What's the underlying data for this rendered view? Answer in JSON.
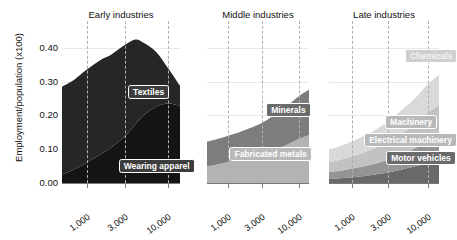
{
  "chart_data": {
    "type": "area",
    "title": "",
    "ylabel": "Employment/population (x100)",
    "xlabel": "",
    "ylim": [
      0.0,
      0.45
    ],
    "yticks": [
      "0.00",
      "0.10",
      "0.20",
      "0.30",
      "0.40"
    ],
    "ytick_values": [
      0.0,
      0.1,
      0.2,
      0.3,
      0.4
    ],
    "xticks": [
      "1,000",
      "3,000",
      "10,000"
    ],
    "xtick_values": [
      1000,
      3000,
      10000
    ],
    "xscale": "log",
    "grid": "vertical dashed at x ticks, faint horizontal at y ticks",
    "legend": "inline labels on stacked areas",
    "stacked": true,
    "panels": [
      {
        "name": "early",
        "title": "Early industries",
        "x": [
          500,
          700,
          1000,
          1500,
          2000,
          3000,
          4000,
          5000,
          7000,
          10000,
          14000
        ],
        "series": [
          {
            "name": "Wearing apparel",
            "color": "#141414",
            "label_tone": "dark",
            "values": [
              0.025,
              0.04,
              0.06,
              0.085,
              0.105,
              0.14,
              0.175,
              0.2,
              0.225,
              0.235,
              0.228
            ]
          },
          {
            "name": "Textiles",
            "color": "#262626",
            "label_tone": "dark",
            "values": [
              0.26,
              0.265,
              0.275,
              0.28,
              0.275,
              0.27,
              0.25,
              0.215,
              0.165,
              0.105,
              0.06
            ]
          }
        ],
        "totals": [
          0.285,
          0.305,
          0.335,
          0.365,
          0.38,
          0.41,
          0.425,
          0.415,
          0.39,
          0.34,
          0.288
        ]
      },
      {
        "name": "middle",
        "title": "Middle industries",
        "x": [
          500,
          700,
          1000,
          1500,
          2000,
          3000,
          4000,
          5000,
          7000,
          10000,
          14000
        ],
        "series": [
          {
            "name": "Fabricated metals",
            "color": "#b3b3b3",
            "label_tone": "light",
            "values": [
              0.05,
              0.055,
              0.062,
              0.07,
              0.076,
              0.085,
              0.094,
              0.102,
              0.115,
              0.13,
              0.142
            ]
          },
          {
            "name": "Minerals",
            "color": "#7d7d7d",
            "label_tone": "mid",
            "values": [
              0.072,
              0.075,
              0.078,
              0.082,
              0.086,
              0.093,
              0.1,
              0.106,
              0.115,
              0.127,
              0.134
            ]
          }
        ],
        "totals": [
          0.122,
          0.13,
          0.14,
          0.152,
          0.162,
          0.178,
          0.194,
          0.208,
          0.23,
          0.257,
          0.276
        ]
      },
      {
        "name": "late",
        "title": "Late industries",
        "x": [
          500,
          700,
          1000,
          1500,
          2000,
          3000,
          4000,
          5000,
          7000,
          10000,
          14000
        ],
        "series": [
          {
            "name": "Motor vehicles",
            "color": "#696969",
            "label_tone": "mid",
            "values": [
              0.012,
              0.014,
              0.017,
              0.021,
              0.025,
              0.031,
              0.037,
              0.042,
              0.05,
              0.06,
              0.068
            ]
          },
          {
            "name": "Electrical machinery",
            "color": "#949494",
            "label_tone": "light",
            "values": [
              0.02,
              0.022,
              0.025,
              0.029,
              0.032,
              0.038,
              0.043,
              0.047,
              0.054,
              0.062,
              0.068
            ]
          },
          {
            "name": "Machinery",
            "color": "#c2c2c2",
            "label_tone": "light",
            "values": [
              0.03,
              0.033,
              0.037,
              0.042,
              0.046,
              0.053,
              0.059,
              0.065,
              0.074,
              0.086,
              0.094
            ]
          },
          {
            "name": "Chemicals",
            "color": "#d9d9d9",
            "label_tone": "lighter",
            "values": [
              0.038,
              0.04,
              0.044,
              0.049,
              0.053,
              0.06,
              0.066,
              0.07,
              0.076,
              0.085,
              0.09
            ]
          }
        ],
        "totals": [
          0.1,
          0.109,
          0.123,
          0.141,
          0.156,
          0.182,
          0.205,
          0.224,
          0.254,
          0.293,
          0.32
        ]
      }
    ]
  }
}
